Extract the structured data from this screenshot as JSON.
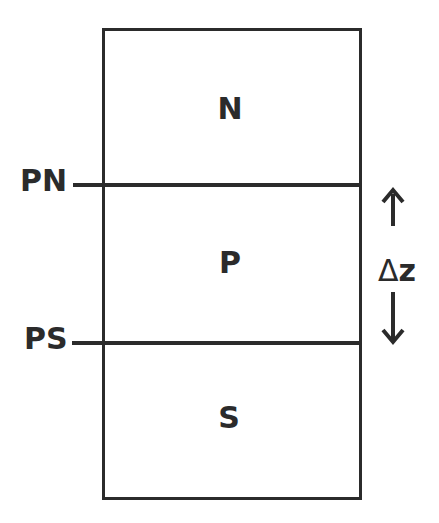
{
  "diagram": {
    "regions": [
      {
        "label": "N"
      },
      {
        "label": "P"
      },
      {
        "label": "S"
      }
    ],
    "boundaries": [
      {
        "label": "PN"
      },
      {
        "label": "PS"
      }
    ],
    "thickness": {
      "delta": "Δ",
      "variable": "z",
      "arrow_up": "up-arrow",
      "arrow_down": "down-arrow"
    },
    "colors": {
      "line": "#2b2b2b",
      "background": "#ffffff"
    }
  }
}
